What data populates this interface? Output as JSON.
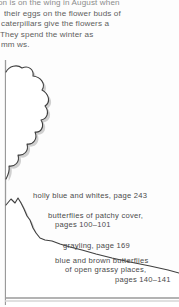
{
  "body_text": {
    "lines": [
      "ion is on the wing in August when",
      "their eggs on the flower buds of",
      "caterpillars give the flowers a",
      "They spend the winter as",
      "mm ws."
    ]
  },
  "diagram": {
    "name": "habitat-profile-diagram",
    "ink_color": "#3a3a3a",
    "shadow_color": "#c9c9c9",
    "background_color": "#ffffff",
    "rule_color": "#8a8a8a",
    "captions": [
      {
        "id": "holly-blue-and-whites",
        "lines": [
          "holly blue and whites, page 243"
        ]
      },
      {
        "id": "butterflies-of-patchy-cover",
        "lines": [
          "butterflies of patchy cover,",
          "pages 100–101"
        ]
      },
      {
        "id": "grayling",
        "lines": [
          "grayling, page 169"
        ]
      },
      {
        "id": "blue-and-brown-butterflies",
        "lines": [
          "blue and brown butterflies",
          "of open grassy places,",
          "pages 140–141"
        ]
      }
    ]
  }
}
